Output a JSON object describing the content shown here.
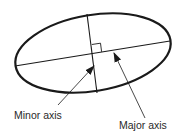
{
  "diagram": {
    "ellipse": {
      "cx": 93,
      "cy": 53,
      "rx": 78.5,
      "ry": 38,
      "rotation_deg": -9.5,
      "stroke": "#1a1a1a",
      "stroke_width": 2.2
    },
    "major_axis": {
      "x1": 15,
      "y1": 66,
      "x2": 170,
      "y2": 41
    },
    "minor_axis": {
      "x1": 87,
      "y1": 14,
      "x2": 97,
      "y2": 93
    },
    "right_angle_marker": {
      "points": "92,45 101,44 102,52"
    },
    "labels": {
      "minor": "Minor axis",
      "major": "Major axis"
    },
    "arrows": {
      "minor": {
        "x1": 58,
        "y1": 105,
        "x2": 94,
        "y2": 66
      },
      "major": {
        "x1": 145,
        "y1": 118,
        "x2": 114,
        "y2": 53
      }
    },
    "colors": {
      "line": "#1a1a1a",
      "text": "#2a2a2a",
      "background": "#ffffff"
    }
  }
}
